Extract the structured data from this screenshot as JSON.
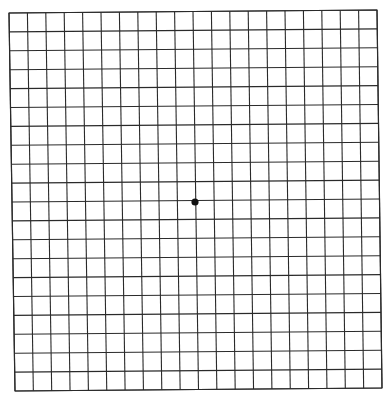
{
  "grid": {
    "type": "amsler-grid",
    "rows": 20,
    "columns": 20,
    "line_color": "#2a2a2a",
    "corners": {
      "top_left": [
        9,
        13
      ],
      "top_right": [
        377,
        10
      ],
      "bottom_left": [
        15,
        391
      ],
      "bottom_right": [
        382,
        388
      ]
    },
    "fixation_dot": {
      "center": [
        195,
        202
      ],
      "radius": 3.6,
      "color": "#111111"
    }
  }
}
